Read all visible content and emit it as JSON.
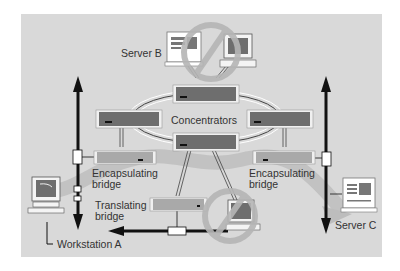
{
  "diagram": {
    "type": "network-topology",
    "labels": {
      "server_b": "Server B",
      "server_c": "Server C",
      "workstation_a": "Workstation A",
      "concentrators": "Concentrators",
      "encap_left_line1": "Encapsulating",
      "encap_left_line2": "bridge",
      "encap_right_line1": "Encapsulating",
      "encap_right_line2": "bridge",
      "translating_line1": "Translating",
      "translating_line2": "bridge"
    },
    "nodes": [
      {
        "id": "server-b",
        "kind": "server",
        "label": "Server B"
      },
      {
        "id": "workstation-top",
        "kind": "workstation",
        "status": "prohibited"
      },
      {
        "id": "concentrator-top",
        "kind": "concentrator"
      },
      {
        "id": "concentrator-left",
        "kind": "concentrator"
      },
      {
        "id": "concentrator-right",
        "kind": "concentrator"
      },
      {
        "id": "concentrator-bottom",
        "kind": "concentrator"
      },
      {
        "id": "encapsulating-bridge-left",
        "kind": "bridge",
        "label": "Encapsulating bridge"
      },
      {
        "id": "encapsulating-bridge-right",
        "kind": "bridge",
        "label": "Encapsulating bridge"
      },
      {
        "id": "translating-bridge",
        "kind": "bridge",
        "label": "Translating bridge"
      },
      {
        "id": "workstation-bottom",
        "kind": "workstation",
        "status": "prohibited"
      },
      {
        "id": "workstation-a",
        "kind": "workstation",
        "label": "Workstation A"
      },
      {
        "id": "server-c",
        "kind": "server",
        "label": "Server C"
      }
    ],
    "icons": [
      "prohibited-icon",
      "prohibited-icon"
    ],
    "colors": {
      "panel": "#d9d9d9",
      "device_dark": "#6e6e6e",
      "device_light": "#a9a9a9",
      "device_frame": "#f0f0f0",
      "path_band": "#bdbdbd",
      "arrow": "#111111",
      "text": "#333333"
    }
  }
}
